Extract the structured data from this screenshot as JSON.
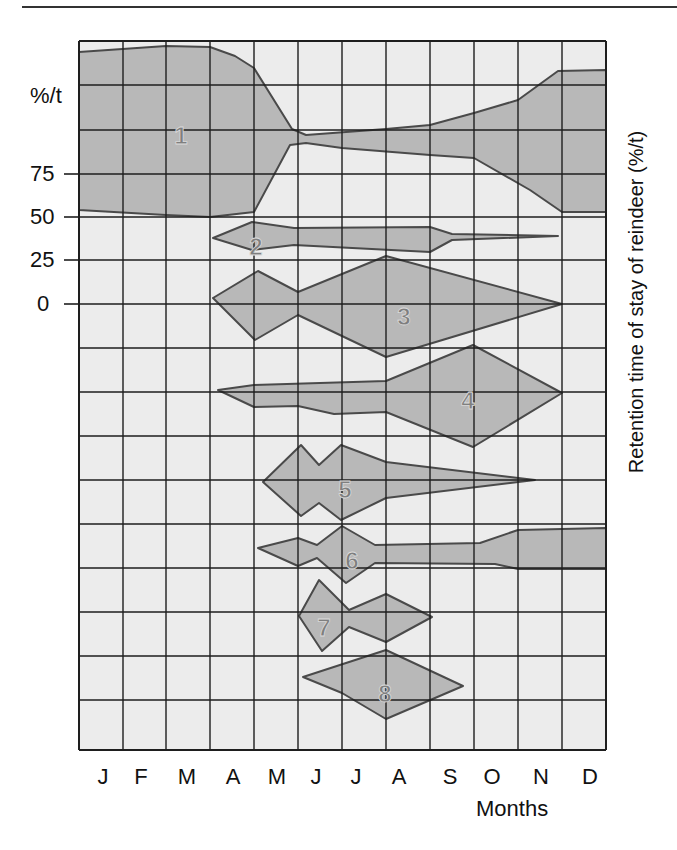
{
  "chart_data": {
    "type": "area",
    "title": "",
    "xlabel": "Months",
    "ylabel_left_unit": "%/t",
    "ylabel_right": "Retention time of stay of reindeer (%/t)",
    "categories": [
      "J",
      "F",
      "M",
      "A",
      "M",
      "J",
      "J",
      "A",
      "S",
      "O",
      "N",
      "D"
    ],
    "y_ticks": [
      {
        "label": "75",
        "y": 174
      },
      {
        "label": "50",
        "y": 217
      },
      {
        "label": "25",
        "y": 260
      },
      {
        "label": "0",
        "y": 304
      }
    ],
    "grid": true,
    "series": [
      {
        "name": "1",
        "label_pos": [
          181,
          135
        ],
        "points": "79,52 166,46 210,47 235,56 254,68 292,129 306,135 386,129 430,125 474,113 518,100 558,71 606,70 606,212 562,212 530,190 474,158 430,155 342,148 306,143 290,145 254,212 210,217 166,215 79,210"
      },
      {
        "name": "2",
        "label_pos": [
          256,
          246
        ],
        "points": "213,238 252,222 294,228 430,227 452,234 558,236 452,240 430,252 294,245 252,250"
      },
      {
        "name": "3",
        "label_pos": [
          404,
          316
        ],
        "points": "213,298 258,271 298,292 386,256 562,304 386,357 298,315 255,340"
      },
      {
        "name": "4",
        "label_pos": [
          468,
          400
        ],
        "points": "218,390 254,385 386,381 473,345 562,393 473,447 386,412 334,414 298,406 254,407"
      },
      {
        "name": "5",
        "label_pos": [
          345,
          489
        ],
        "points": "263,482 301,445 319,465 341,445 386,462 535,480 386,498 341,520 319,503 301,516"
      },
      {
        "name": "6",
        "label_pos": [
          352,
          560
        ],
        "points": "258,548 298,538 317,545 342,526 375,545 480,543 518,530 606,528 606,569 518,569 495,564 375,563 346,583 317,558 298,566"
      },
      {
        "name": "7",
        "label_pos": [
          324,
          627
        ],
        "points": "299,616 319,580 349,610 386,594 432,617 386,642 349,627 322,651"
      },
      {
        "name": "8",
        "label_pos": [
          385,
          693
        ],
        "points": "303,677 386,650 463,686 386,719 342,693"
      }
    ],
    "colors": {
      "background": "#ececec",
      "fill": "#b8b8b8",
      "outline": "#4a4a4a",
      "grid": "#1e1e1e",
      "label": "#7f7f7f"
    }
  }
}
